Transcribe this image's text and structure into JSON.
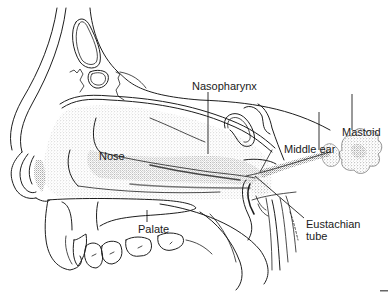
{
  "figure": {
    "type": "anatomical sagittal section of head",
    "colors": {
      "ink": "#1e1e1e",
      "stipple": "#8a8a8a",
      "background": "#ffffff"
    },
    "labels": {
      "nasopharynx": "Nasopharynx",
      "nose": "Nose",
      "middle_ear": "Middle ear",
      "mastoid": "Mastoid",
      "palate": "Palate",
      "eustachian_line1": "Eustachian",
      "eustachian_line2": "tube"
    }
  }
}
